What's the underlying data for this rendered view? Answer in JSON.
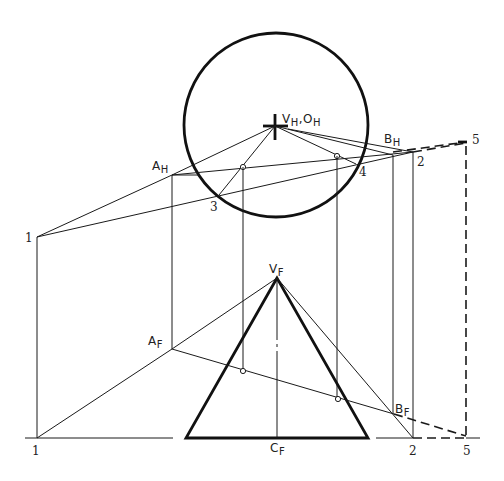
{
  "diagram": {
    "type": "descriptive-geometry-construction",
    "labels": {
      "vh_main": "V",
      "vh_sub": "H",
      "oh_sep": ",O",
      "oh_sub": "H",
      "ah_main": "A",
      "ah_sub": "H",
      "bh_main": "B",
      "bh_sub": "H",
      "vf_main": "V",
      "vf_sub": "F",
      "af_main": "A",
      "af_sub": "F",
      "bf_main": "B",
      "bf_sub": "F",
      "cf_main": "C",
      "cf_sub": "F",
      "p1_top": "1",
      "p1_bottom": "1",
      "p2_top": "2",
      "p2_bottom": "2",
      "p3": "3",
      "p4": "4",
      "p5_top": "5",
      "p5_bottom": "5"
    },
    "views": [
      {
        "name": "top view",
        "elements": [
          "cone base circle",
          "V_H,O_H apex/center",
          "line A_H-B_H",
          "points 1,2,3,4,5"
        ]
      },
      {
        "name": "front view",
        "elements": [
          "cone triangle",
          "V_F apex",
          "C_F base center",
          "line A_F-B_F",
          "points 1,2,5"
        ]
      }
    ],
    "colors": {
      "line": "#1a1a1a",
      "background": "#ffffff"
    }
  }
}
